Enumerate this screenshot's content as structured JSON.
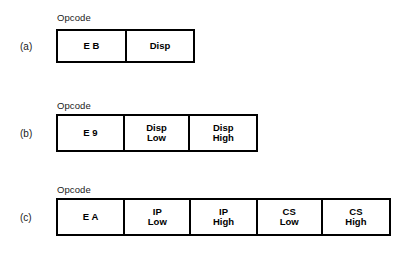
{
  "figure": {
    "background_color": "#ffffff",
    "line_color": "#000000",
    "text_color": "#000000",
    "rows": [
      {
        "id": "a",
        "label": "(a)",
        "header_label": "Opcode",
        "cells": [
          {
            "line1": "E  B",
            "line2": ""
          },
          {
            "line1": "Disp",
            "line2": ""
          }
        ]
      },
      {
        "id": "b",
        "label": "(b)",
        "header_label": "Opcode",
        "cells": [
          {
            "line1": "E  9",
            "line2": ""
          },
          {
            "line1": "Disp",
            "line2": "Low"
          },
          {
            "line1": "Disp",
            "line2": "High"
          }
        ]
      },
      {
        "id": "c",
        "label": "(c)",
        "header_label": "Opcode",
        "cells": [
          {
            "line1": "E  A",
            "line2": ""
          },
          {
            "line1": "IP",
            "line2": "Low"
          },
          {
            "line1": "IP",
            "line2": "High"
          },
          {
            "line1": "CS",
            "line2": "Low"
          },
          {
            "line1": "CS",
            "line2": "High"
          }
        ]
      }
    ]
  }
}
